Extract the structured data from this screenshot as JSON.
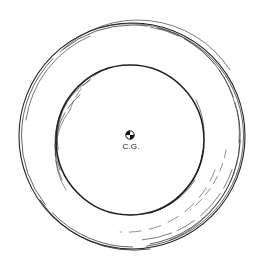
{
  "diagram": {
    "type": "patent-style line drawing",
    "cg_label": "C.G.",
    "colors": {
      "line": "#222222",
      "background": "#ffffff"
    },
    "outer_ring": {
      "cx": 132,
      "cy": 136,
      "r": 113
    },
    "inner_ring": {
      "cx": 130,
      "cy": 140,
      "rx": 74,
      "ry": 75
    },
    "center_of_gravity": {
      "cx": 130,
      "cy": 135,
      "r": 4
    }
  }
}
